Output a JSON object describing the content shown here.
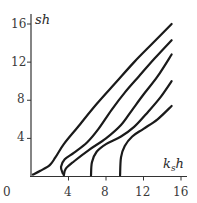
{
  "chart_data": {
    "type": "line",
    "title": "",
    "xlabel": "k_s h",
    "ylabel": "sh",
    "xlim": [
      0,
      16
    ],
    "ylim": [
      0,
      17
    ],
    "x_ticks": [
      "0",
      "4",
      "8",
      "12",
      "16"
    ],
    "y_ticks": [
      "4",
      "8",
      "12",
      "16"
    ],
    "grid": false,
    "legend": null,
    "series": [
      {
        "name": "curve-1",
        "points": [
          [
            0.2,
            0.2
          ],
          [
            1,
            0.6
          ],
          [
            2,
            1.2
          ],
          [
            2.6,
            2
          ],
          [
            3.5,
            3.4
          ],
          [
            5,
            5.2
          ],
          [
            7,
            7.6
          ],
          [
            9,
            9.8
          ],
          [
            11,
            12
          ],
          [
            13,
            14
          ],
          [
            15,
            16
          ]
        ]
      },
      {
        "name": "curve-2",
        "points": [
          [
            3.4,
            0.3
          ],
          [
            3.2,
            1
          ],
          [
            3.6,
            1.8
          ],
          [
            4.6,
            2.5
          ],
          [
            6,
            3.6
          ],
          [
            7.2,
            5
          ],
          [
            8.6,
            7
          ],
          [
            10,
            8.8
          ],
          [
            11.5,
            10.5
          ],
          [
            13.2,
            12.4
          ],
          [
            15,
            14.3
          ]
        ]
      },
      {
        "name": "curve-3",
        "points": [
          [
            3.5,
            0.1
          ],
          [
            3.7,
            0.8
          ],
          [
            4.6,
            1.6
          ],
          [
            6.2,
            2.8
          ],
          [
            8,
            4
          ],
          [
            9.6,
            5.4
          ],
          [
            10.8,
            7
          ],
          [
            12,
            8.6
          ],
          [
            13.5,
            10.5
          ],
          [
            15,
            12.8
          ]
        ]
      },
      {
        "name": "curve-4",
        "points": [
          [
            6.4,
            0.1
          ],
          [
            6.5,
            1.5
          ],
          [
            7,
            2.6
          ],
          [
            8,
            3.4
          ],
          [
            9.6,
            4.2
          ],
          [
            11,
            5.2
          ],
          [
            12.5,
            6.8
          ],
          [
            13.8,
            8.3
          ],
          [
            15,
            10
          ]
        ]
      },
      {
        "name": "curve-5",
        "points": [
          [
            9.5,
            0.1
          ],
          [
            9.6,
            2
          ],
          [
            10,
            3.2
          ],
          [
            10.8,
            4.2
          ],
          [
            12,
            5
          ],
          [
            13.5,
            6
          ],
          [
            15,
            7.4
          ]
        ]
      }
    ]
  }
}
